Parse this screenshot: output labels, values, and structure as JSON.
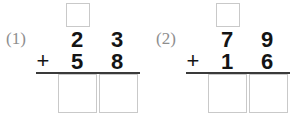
{
  "worksheet": {
    "type": "vertical-addition-exercise",
    "operator": "+",
    "colors": {
      "digit": "#141414",
      "label": "#8e8e8e",
      "box_border": "#c9c9c9",
      "rule": "#3a3a3a",
      "background": "#ffffff"
    },
    "problems": [
      {
        "label": "(1)",
        "addend1": {
          "tens": "2",
          "ones": "3"
        },
        "addend2": {
          "tens": "5",
          "ones": "8"
        },
        "operator": "+",
        "carry_box_value": "",
        "answer_tens_value": "",
        "answer_ones_value": ""
      },
      {
        "label": "(2)",
        "addend1": {
          "tens": "7",
          "ones": "9"
        },
        "addend2": {
          "tens": "1",
          "ones": "6"
        },
        "operator": "+",
        "carry_box_value": "",
        "answer_tens_value": "",
        "answer_ones_value": ""
      }
    ]
  }
}
